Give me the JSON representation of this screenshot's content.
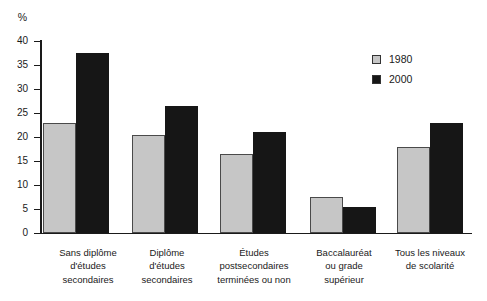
{
  "chart_data": {
    "type": "bar",
    "title": "",
    "xlabel": "",
    "ylabel": "%",
    "ylim": [
      0,
      40
    ],
    "yticks": [
      0,
      5,
      10,
      15,
      20,
      25,
      30,
      35,
      40
    ],
    "grid": false,
    "legend_position": "upper-right",
    "background_color": "#ffffff",
    "axis_color": "#1a1a1a",
    "text_color": "#1a1a1a",
    "categories": [
      "Sans diplôme\nd'études\nsecondaires",
      "Diplôme\nd'études\nsecondaires",
      "Études\npostsecondaires\nterminées ou non",
      "Baccalauréat\nou grade\nsupérieur",
      "Tous les niveaux\nde scolarité"
    ],
    "series": [
      {
        "name": "1980",
        "color": "#c6c6c6",
        "border_color": "#4a4a4a",
        "values": [
          23,
          20.5,
          16.5,
          7.5,
          18
        ]
      },
      {
        "name": "2000",
        "color": "#161616",
        "border_color": "#161616",
        "values": [
          37.5,
          26.5,
          21,
          5.5,
          23
        ]
      }
    ]
  }
}
